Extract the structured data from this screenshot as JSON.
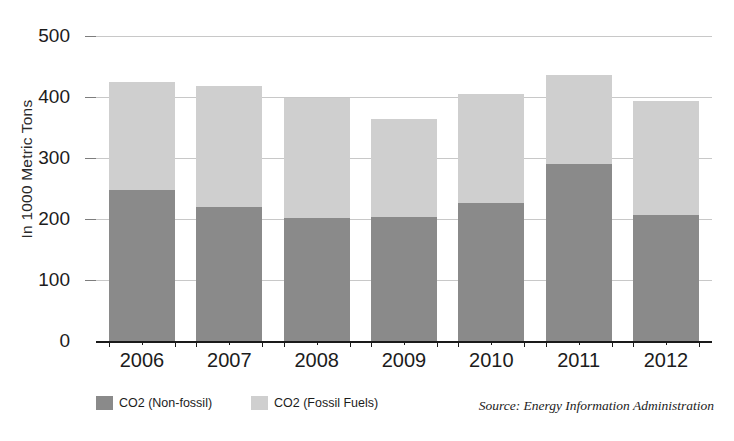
{
  "chart_data": {
    "type": "bar",
    "subtype": "stacked-vertical",
    "title": "",
    "xlabel": "",
    "ylabel": "In 1000 Metric Tons",
    "categories": [
      "2006",
      "2007",
      "2008",
      "2009",
      "2010",
      "2011",
      "2012"
    ],
    "ylim": [
      0,
      500
    ],
    "yticks": [
      0,
      100,
      200,
      300,
      400,
      500
    ],
    "ytick_labels": [
      "0",
      "100",
      "200",
      "300",
      "400",
      "500"
    ],
    "grid": true,
    "grid_axis": "y",
    "legend_position": "bottom-left",
    "series": [
      {
        "name": "CO2 (Non-fossil)",
        "color": "#8a8a8a",
        "values": [
          248,
          220,
          202,
          204,
          227,
          290,
          206
        ]
      },
      {
        "name": "CO2 (Fossil Fuels)",
        "color": "#cfcfcf",
        "values": [
          177,
          198,
          196,
          160,
          178,
          146,
          187
        ]
      }
    ],
    "totals": [
      425,
      418,
      398,
      364,
      405,
      436,
      393
    ],
    "annotations": [
      "Source: Energy Information Administration"
    ]
  },
  "axis": {
    "y_title": "In 1000 Metric Tons",
    "y_ticks": [
      "500",
      "400",
      "300",
      "200",
      "100",
      "0"
    ],
    "x_labels": [
      "2006",
      "2007",
      "2008",
      "2009",
      "2010",
      "2011",
      "2012"
    ]
  },
  "legend": {
    "items": [
      {
        "label": "CO2 (Non-fossil)",
        "color": "#8a8a8a"
      },
      {
        "label": "CO2 (Fossil Fuels)",
        "color": "#cfcfcf"
      }
    ]
  },
  "source": {
    "text": "Source: Energy Information Administration"
  },
  "colors": {
    "non_fossil": "#8a8a8a",
    "fossil_fuels": "#cfcfcf",
    "gridline": "#c8c8c8",
    "axis": "#1a1a1a",
    "text": "#1c1c1c",
    "background": "#ffffff"
  }
}
